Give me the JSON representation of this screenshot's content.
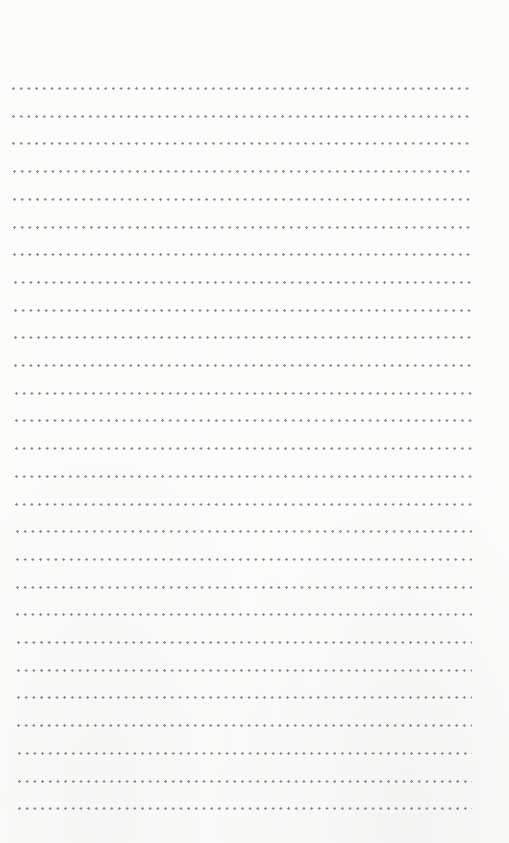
{
  "page": {
    "type": "ruled-dotted-sheet",
    "line_count": 27,
    "first_line_y": 87,
    "line_spacing": 27.7,
    "line_start_x": 12,
    "line_end_x": 472,
    "dot_color": "#8a8a8a",
    "background_color": "#fcfcfb"
  }
}
